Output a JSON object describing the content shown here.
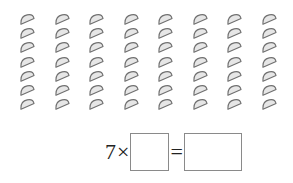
{
  "figure": {
    "rows": 7,
    "columns": 8,
    "item_icon": "semicircle-dumpling-icon",
    "item_fill": "#e6e6e6",
    "item_stroke": "#6f6f6f"
  },
  "equation": {
    "factor": "7",
    "times": "×",
    "equals": "=",
    "blank1": "",
    "blank2": ""
  }
}
